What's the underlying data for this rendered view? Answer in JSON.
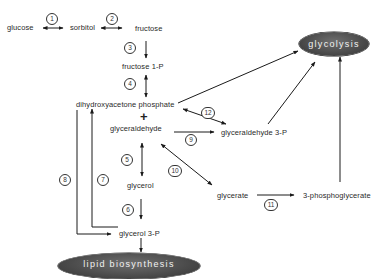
{
  "diagram": {
    "nodes": {
      "glucose": "glucose",
      "sorbitol": "sorbitol",
      "fructose": "fructose",
      "fructose_1p": "fructose 1-P",
      "dhap": "dihydroxyacetone phosphate",
      "plus": "+",
      "glyceraldehyde": "glyceraldehyde",
      "glyceraldehyde_3p": "glyceraldehyde 3-P",
      "glycerol": "glycerol",
      "glycerate": "glycerate",
      "phosphoglycerate_3": "3-phosphoglycerate",
      "glycerol_3p": "glycerol 3-P",
      "glycolysis": "glycolysis",
      "lipid_biosynthesis": "lipid biosynthesis"
    },
    "steps": [
      "1",
      "2",
      "3",
      "4",
      "5",
      "6",
      "7",
      "8",
      "9",
      "10",
      "11",
      "12"
    ],
    "edges": [
      {
        "step": "1",
        "from": "glucose",
        "to": "sorbitol",
        "type": "bidirectional"
      },
      {
        "step": "2",
        "from": "sorbitol",
        "to": "fructose",
        "type": "bidirectional"
      },
      {
        "step": "3",
        "from": "fructose",
        "to": "fructose 1-P",
        "type": "forward"
      },
      {
        "step": "4",
        "from": "fructose 1-P",
        "to": "dihydroxyacetone phosphate + glyceraldehyde",
        "type": "bidirectional"
      },
      {
        "step": "5",
        "from": "glyceraldehyde",
        "to": "glycerol",
        "type": "bidirectional"
      },
      {
        "step": "6",
        "from": "glycerol",
        "to": "glycerol 3-P",
        "type": "forward"
      },
      {
        "step": "7",
        "from": "glycerol 3-P",
        "to": "dihydroxyacetone phosphate",
        "type": "forward"
      },
      {
        "step": "8",
        "from": "dihydroxyacetone phosphate",
        "to": "glycerol 3-P",
        "type": "forward"
      },
      {
        "step": "9",
        "from": "glyceraldehyde",
        "to": "glyceraldehyde 3-P",
        "type": "forward"
      },
      {
        "step": "10",
        "from": "glyceraldehyde",
        "to": "glycerate",
        "type": "bidirectional"
      },
      {
        "step": "11",
        "from": "glycerate",
        "to": "3-phosphoglycerate",
        "type": "forward"
      },
      {
        "step": "12",
        "from": "dihydroxyacetone phosphate",
        "to": "glyceraldehyde 3-P",
        "type": "bidirectional"
      },
      {
        "step": "",
        "from": "dihydroxyacetone phosphate",
        "to": "glycolysis",
        "type": "forward"
      },
      {
        "step": "",
        "from": "glyceraldehyde 3-P",
        "to": "glycolysis",
        "type": "forward"
      },
      {
        "step": "",
        "from": "3-phosphoglycerate",
        "to": "glycolysis",
        "type": "forward"
      },
      {
        "step": "",
        "from": "glycerol 3-P",
        "to": "lipid biosynthesis",
        "type": "forward"
      }
    ]
  }
}
